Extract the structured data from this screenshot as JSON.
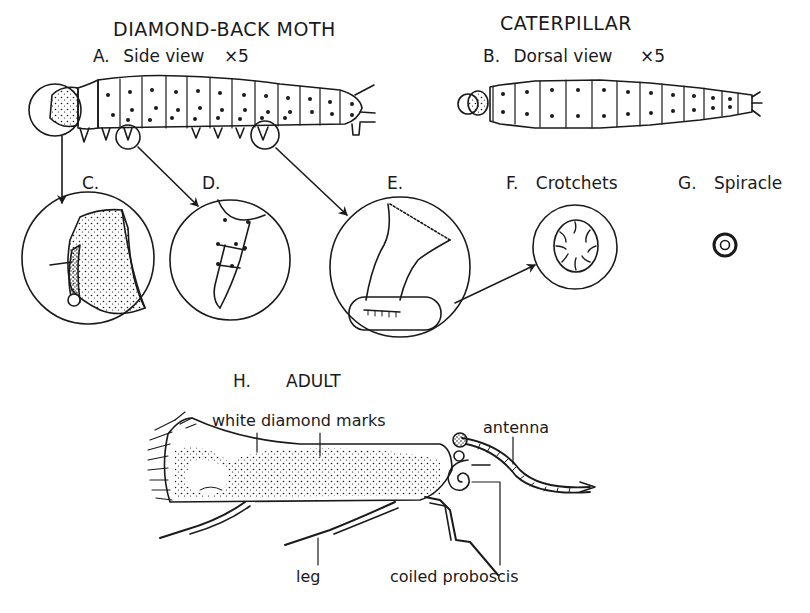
{
  "figure": {
    "section_caterpillar": {
      "heading_left": "DIAMOND-BACK MOTH",
      "heading_right": "CATERPILLAR",
      "panels": [
        {
          "letter": "A.",
          "label": "Side view",
          "scale": "×5"
        },
        {
          "letter": "B.",
          "label": "Dorsal view",
          "scale": "×5"
        },
        {
          "letter": "C.",
          "label": ""
        },
        {
          "letter": "D.",
          "label": ""
        },
        {
          "letter": "E.",
          "label": ""
        },
        {
          "letter": "F.",
          "label": "Crotchets"
        },
        {
          "letter": "G.",
          "label": "Spiracle"
        }
      ]
    },
    "section_adult": {
      "letter": "H.",
      "heading": "ADULT",
      "callouts": {
        "white_diamond_marks": "white diamond marks",
        "antenna": "antenna",
        "leg": "leg",
        "coiled_proboscis": "coiled proboscis"
      }
    },
    "colors": {
      "ink": "#1a1a1a",
      "paper": "#ffffff"
    }
  }
}
